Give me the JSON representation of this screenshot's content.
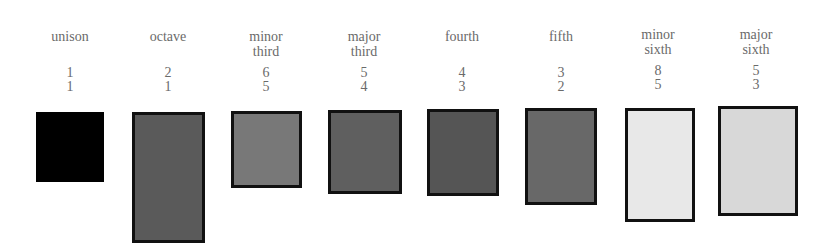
{
  "intervals": [
    {
      "name": "unison",
      "name_line1": "unison",
      "name_line2": "",
      "numerator": "1",
      "denominator": "1",
      "fill": "#000000",
      "bordered": false
    },
    {
      "name": "octave",
      "name_line1": "octave",
      "name_line2": "",
      "numerator": "2",
      "denominator": "1",
      "fill": "#5a5a5a",
      "bordered": true
    },
    {
      "name": "minor third",
      "name_line1": "minor",
      "name_line2": "third",
      "numerator": "6",
      "denominator": "5",
      "fill": "#787878",
      "bordered": true
    },
    {
      "name": "major third",
      "name_line1": "major",
      "name_line2": "third",
      "numerator": "5",
      "denominator": "4",
      "fill": "#5f5f5f",
      "bordered": true
    },
    {
      "name": "fourth",
      "name_line1": "fourth",
      "name_line2": "",
      "numerator": "4",
      "denominator": "3",
      "fill": "#555555",
      "bordered": true
    },
    {
      "name": "fifth",
      "name_line1": "fifth",
      "name_line2": "",
      "numerator": "3",
      "denominator": "2",
      "fill": "#686868",
      "bordered": true
    },
    {
      "name": "minor sixth",
      "name_line1": "minor",
      "name_line2": "sixth",
      "numerator": "8",
      "denominator": "5",
      "fill": "#e8e8e8",
      "bordered": true
    },
    {
      "name": "major sixth",
      "name_line1": "major",
      "name_line2": "sixth",
      "numerator": "5",
      "denominator": "3",
      "fill": "#d8d8d8",
      "bordered": true
    }
  ]
}
